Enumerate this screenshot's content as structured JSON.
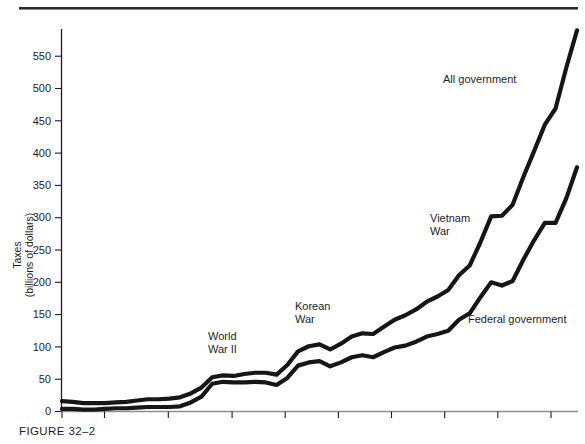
{
  "figure": {
    "caption": "FIGURE 32–2"
  },
  "chart_data": {
    "type": "line",
    "title": "",
    "xlabel": "",
    "ylabel": "Taxes\n(billions of dollars)",
    "ylabel_line1": "Taxes",
    "ylabel_line2": "(billions of dollars)",
    "xlim": [
      1929,
      1977
    ],
    "ylim": [
      0,
      600
    ],
    "grid": false,
    "legend": "inline-annotations",
    "yticks": [
      0,
      50,
      100,
      150,
      200,
      250,
      300,
      350,
      400,
      450,
      500,
      550
    ],
    "yticklabels": [
      "0",
      "50",
      "100",
      "150",
      "200",
      "250",
      "300",
      "350",
      "400",
      "450",
      "500",
      "550"
    ],
    "xticks": [
      1929,
      1933,
      1939,
      1945,
      1950,
      1955,
      1960,
      1965,
      1970,
      1975
    ],
    "xticklabels": [
      "1929",
      "1933",
      "1939",
      "1945",
      "1950",
      "1955",
      "1960",
      "1965",
      "1970",
      "1975"
    ],
    "x": [
      1929,
      1930,
      1931,
      1932,
      1933,
      1934,
      1935,
      1936,
      1937,
      1938,
      1939,
      1940,
      1941,
      1942,
      1943,
      1944,
      1945,
      1946,
      1947,
      1948,
      1949,
      1950,
      1951,
      1952,
      1953,
      1954,
      1955,
      1956,
      1957,
      1958,
      1959,
      1960,
      1961,
      1962,
      1963,
      1964,
      1965,
      1966,
      1967,
      1968,
      1969,
      1970,
      1971,
      1972,
      1973,
      1974,
      1975,
      1976,
      1977
    ],
    "series": [
      {
        "name": "All government",
        "label": "All government",
        "color": "#161616",
        "values": [
          16,
          15,
          13,
          13,
          13,
          14,
          15,
          17,
          19,
          19,
          20,
          22,
          28,
          37,
          53,
          56,
          55,
          58,
          60,
          60,
          57,
          72,
          93,
          101,
          104,
          96,
          105,
          116,
          121,
          120,
          131,
          142,
          149,
          158,
          170,
          178,
          188,
          211,
          226,
          262,
          302,
          303,
          320,
          363,
          403,
          444,
          469,
          532,
          590
        ]
      },
      {
        "name": "Federal government",
        "label": "Federal government",
        "color": "#161616",
        "values": [
          4,
          4,
          3,
          3,
          4,
          5,
          5,
          6,
          7,
          7,
          7,
          8,
          14,
          23,
          43,
          46,
          45,
          45,
          46,
          45,
          41,
          52,
          71,
          76,
          78,
          70,
          76,
          84,
          87,
          84,
          92,
          99,
          102,
          108,
          116,
          120,
          125,
          142,
          152,
          177,
          200,
          195,
          202,
          235,
          265,
          292,
          292,
          330,
          378
        ]
      }
    ],
    "annotations": [
      {
        "text_line1": "World",
        "text_line2": "War II",
        "x_px": 208,
        "y_px": 340
      },
      {
        "text_line1": "Korean",
        "text_line2": "War",
        "x_px": 295,
        "y_px": 310
      },
      {
        "text_line1": "Vietnam",
        "text_line2": "War",
        "x_px": 430,
        "y_px": 222
      },
      {
        "text_line1": "All government",
        "text_line2": "",
        "x_px": 443,
        "y_px": 83
      },
      {
        "text_line1": "Federal government",
        "text_line2": "",
        "x_px": 468,
        "y_px": 323
      }
    ]
  }
}
